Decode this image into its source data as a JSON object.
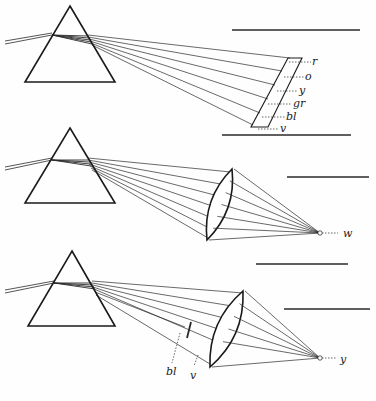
{
  "figure": {
    "colors": {
      "ink": "#1a1a1a",
      "ray": "#2a2a2a",
      "background": "#fefefe"
    },
    "panels": [
      {
        "id": "spectrum-on-screen",
        "prism": {
          "apex": [
            70,
            6
          ],
          "base_left": [
            25,
            82
          ],
          "base_right": [
            115,
            82
          ]
        },
        "incident_rays": [
          [
            [
              5,
              44
            ],
            [
              52,
              35
            ]
          ],
          [
            [
              5,
              41
            ],
            [
              52,
              33
            ]
          ]
        ],
        "internal_fan": {
          "from": [
            52,
            35
          ],
          "to": [
            [
              88,
              36
            ],
            [
              89,
              38
            ],
            [
              90,
              40
            ],
            [
              91,
              42
            ],
            [
              92,
              44
            ]
          ]
        },
        "emergent_rays": [
          [
            [
              88,
              35
            ],
            [
              290,
              58
            ]
          ],
          [
            [
              88,
              37
            ],
            [
              282,
              71
            ]
          ],
          [
            [
              89,
              39
            ],
            [
              275,
              85
            ]
          ],
          [
            [
              90,
              41
            ],
            [
              268,
              99
            ]
          ],
          [
            [
              91,
              43
            ],
            [
              260,
              113
            ]
          ],
          [
            [
              92,
              45
            ],
            [
              253,
              125
            ]
          ]
        ],
        "screen": [
          [
            288,
            58
          ],
          [
            302,
            58
          ],
          [
            268,
            127
          ],
          [
            251,
            127
          ]
        ],
        "spectrum_labels": [
          {
            "text": "r",
            "y": 62,
            "x": 312,
            "lead_from": 289
          },
          {
            "text": "o",
            "y": 77,
            "x": 305,
            "lead_from": 284
          },
          {
            "text": "y",
            "y": 91,
            "x": 299,
            "lead_from": 277
          },
          {
            "text": "gr",
            "y": 104,
            "x": 293,
            "lead_from": 268
          },
          {
            "text": "bl",
            "y": 117,
            "x": 286,
            "lead_from": 262
          },
          {
            "text": "v",
            "y": 129,
            "x": 280,
            "lead_from": 258
          }
        ],
        "rules": [
          [
            [
              232,
              30
            ],
            [
              360,
              30
            ]
          ]
        ]
      },
      {
        "id": "recombined-white",
        "prism": {
          "apex": [
            70,
            128
          ],
          "base_left": [
            25,
            203
          ],
          "base_right": [
            115,
            203
          ]
        },
        "incident_rays": [
          [
            [
              5,
              170
            ],
            [
              52,
              160
            ]
          ],
          [
            [
              5,
              167
            ],
            [
              52,
              158
            ]
          ]
        ],
        "internal_fan": {
          "from": [
            52,
            160
          ],
          "to": [
            [
              88,
              160
            ],
            [
              89,
              162
            ],
            [
              90,
              164
            ],
            [
              91,
              166
            ]
          ]
        },
        "emergent_rays": [
          [
            [
              88,
              158
            ],
            [
              231,
              172
            ]
          ],
          [
            [
              88,
              160
            ],
            [
              226,
              185
            ]
          ],
          [
            [
              89,
              162
            ],
            [
              222,
              197
            ]
          ],
          [
            [
              89,
              164
            ],
            [
              218,
              208
            ]
          ],
          [
            [
              90,
              166
            ],
            [
              214,
              219
            ]
          ],
          [
            [
              91,
              168
            ],
            [
              211,
              229
            ]
          ],
          [
            [
              92,
              170
            ],
            [
              208,
              238
            ]
          ]
        ],
        "lens": {
          "top": [
            232,
            169
          ],
          "bottom": [
            207,
            240
          ],
          "bulge": 9
        },
        "focus": {
          "point": [
            320,
            233
          ],
          "label": "w",
          "label_pos": [
            343,
            237
          ],
          "lead_to": 338
        },
        "rules": [
          [
            [
              222,
              135
            ],
            [
              351,
              135
            ]
          ],
          [
            [
              287,
              177
            ],
            [
              369,
              177
            ]
          ]
        ]
      },
      {
        "id": "blocked-blue-violet-yellow",
        "prism": {
          "apex": [
            72,
            251
          ],
          "base_left": [
            28,
            326
          ],
          "base_right": [
            115,
            326
          ]
        },
        "incident_rays": [
          [
            [
              5,
              293
            ],
            [
              54,
              283
            ]
          ],
          [
            [
              5,
              290
            ],
            [
              54,
              281
            ]
          ]
        ],
        "internal_fan": {
          "from": [
            54,
            283
          ],
          "to": [
            [
              92,
              283
            ],
            [
              93,
              285
            ],
            [
              94,
              287
            ],
            [
              95,
              289
            ]
          ]
        },
        "emergent_rays": [
          [
            [
              92,
              281
            ],
            [
              243,
              293
            ]
          ],
          [
            [
              92,
              283
            ],
            [
              238,
              307
            ]
          ],
          [
            [
              93,
              285
            ],
            [
              232,
              320
            ]
          ],
          [
            [
              93,
              287
            ],
            [
              227,
              332
            ]
          ],
          [
            [
              94,
              289
            ],
            [
              222,
              344
            ]
          ],
          [
            [
              95,
              292
            ],
            [
              185,
              327
            ]
          ],
          [
            [
              96,
              295
            ],
            [
              210,
              364
            ]
          ]
        ],
        "stop": {
          "from": [
            191,
            322
          ],
          "to": [
            187,
            338
          ]
        },
        "lens": {
          "top": [
            243,
            291
          ],
          "bottom": [
            210,
            367
          ],
          "bulge": 10
        },
        "focus": {
          "point": [
            320,
            358
          ],
          "label": "y",
          "label_pos": [
            340,
            363
          ],
          "lead_to": 337
        },
        "drop_labels": [
          {
            "text": "bl",
            "lead": [
              [
                180,
                333
              ],
              [
                172,
                363
              ]
            ],
            "pos": [
              166,
              375
            ]
          },
          {
            "text": "v",
            "lead": [
              [
                198,
                355
              ],
              [
                194,
                366
              ]
            ],
            "pos": [
              190,
              379
            ]
          }
        ],
        "rules": [
          [
            [
              256,
              264
            ],
            [
              348,
              264
            ]
          ],
          [
            [
              284,
              309
            ],
            [
              370,
              309
            ]
          ]
        ]
      }
    ]
  }
}
